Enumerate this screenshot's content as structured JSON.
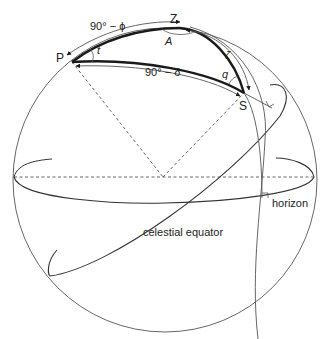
{
  "figure": {
    "colors": {
      "background": "#ffffff",
      "thin_line": "#555555",
      "thick_line": "#1a1a1a",
      "text": "#222222"
    }
  },
  "points": {
    "pole": "P",
    "zenith": "Z",
    "star": "S"
  },
  "arc_labels": {
    "pz": "90° − ϕ",
    "ps": "90° − δ",
    "zs": "ζ"
  },
  "angle_labels": {
    "at_pole": "t",
    "at_zenith": "A",
    "at_star": "q"
  },
  "circle_labels": {
    "horizon": "horizon",
    "equator": "celestial equator"
  }
}
